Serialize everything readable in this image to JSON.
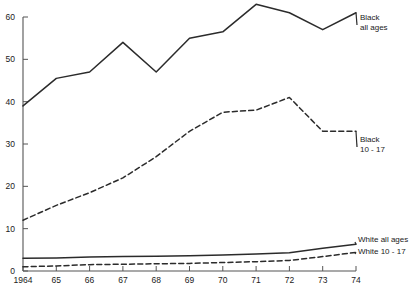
{
  "chart_data": {
    "type": "line",
    "title": "",
    "subtitle": "",
    "xlabel": "",
    "ylabel": "",
    "x": [
      1964,
      1965,
      1966,
      1967,
      1968,
      1969,
      1970,
      1971,
      1972,
      1973,
      1974
    ],
    "xtick_labels": [
      "1964",
      "65",
      "66",
      "67",
      "68",
      "69",
      "70",
      "71",
      "72",
      "73",
      "74"
    ],
    "ytick_labels": [
      "0",
      "10",
      "20",
      "30",
      "40",
      "50",
      "60"
    ],
    "yticks": [
      0,
      10,
      20,
      30,
      40,
      50,
      60
    ],
    "ylim": [
      0,
      60
    ],
    "xlim": [
      1964,
      1974
    ],
    "grid": false,
    "legend_position": "right-inline-labels",
    "series": [
      {
        "name": "Black all ages",
        "label_lines": [
          "Black",
          "all ages"
        ],
        "style": "solid",
        "color": "#2b2b2b",
        "values": [
          39,
          45.5,
          47,
          54,
          47,
          55,
          56.5,
          63,
          61,
          57,
          61
        ]
      },
      {
        "name": "Black 10-17",
        "label_lines": [
          "Black",
          "10 - 17"
        ],
        "style": "dashed",
        "color": "#2b2b2b",
        "values": [
          12,
          15.5,
          18.5,
          22,
          27,
          33,
          37.5,
          38,
          41,
          33,
          33
        ]
      },
      {
        "name": "White all ages",
        "label_lines": [
          "White all ages"
        ],
        "style": "solid",
        "color": "#2b2b2b",
        "values": [
          3,
          3.1,
          3.3,
          3.4,
          3.5,
          3.6,
          3.8,
          4.0,
          4.3,
          5.4,
          6.3
        ]
      },
      {
        "name": "White 10-17",
        "label_lines": [
          "White 10 - 17"
        ],
        "style": "dashed",
        "color": "#2b2b2b",
        "values": [
          1,
          1.2,
          1.5,
          1.6,
          1.7,
          1.8,
          2.0,
          2.2,
          2.5,
          3.4,
          4.4
        ]
      }
    ]
  }
}
